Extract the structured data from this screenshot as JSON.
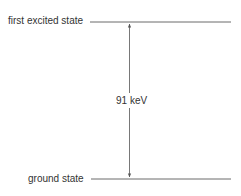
{
  "diagram": {
    "type": "energy-level-diagram",
    "levels": [
      {
        "label": "first excited state"
      },
      {
        "label": "ground state"
      }
    ],
    "transition": {
      "label": "91 keV",
      "direction": "bidirectional"
    },
    "colors": {
      "line": "#6b6b6b",
      "text": "#333333"
    }
  }
}
